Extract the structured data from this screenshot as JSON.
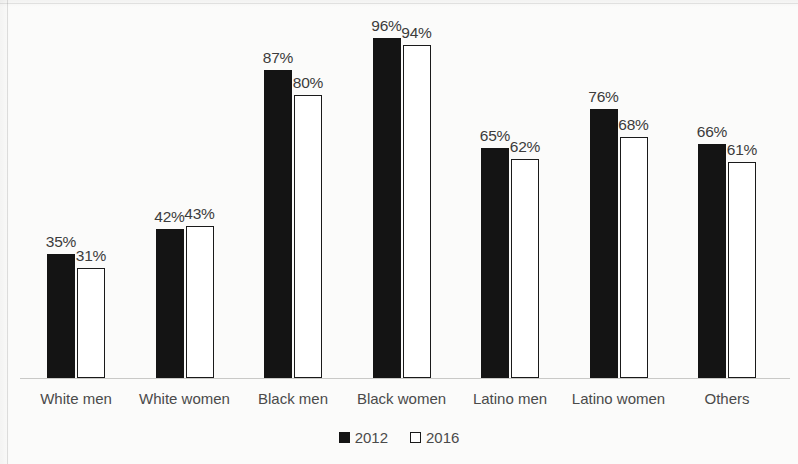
{
  "chart_data": {
    "type": "bar",
    "title": "",
    "subtitle": "",
    "xlabel": "",
    "ylabel": "",
    "ylim": [
      0,
      100
    ],
    "grid": false,
    "legend_position": "bottom-center",
    "value_suffix": "%",
    "categories": [
      "White men",
      "White women",
      "Black men",
      "Black women",
      "Latino men",
      "Latino women",
      "Others"
    ],
    "series": [
      {
        "name": "2012",
        "color": "#141414",
        "style": "filled",
        "values": [
          35,
          42,
          87,
          96,
          65,
          76,
          66
        ],
        "labels": [
          "35%",
          "42%",
          "87%",
          "96%",
          "65%",
          "76%",
          "66%"
        ]
      },
      {
        "name": "2016",
        "color": "#ffffff",
        "style": "outlined",
        "values": [
          31,
          43,
          80,
          94,
          62,
          68,
          61
        ],
        "labels": [
          "31%",
          "43%",
          "80%",
          "94%",
          "62%",
          "68%",
          "61%"
        ]
      }
    ]
  },
  "legend": {
    "items": [
      {
        "label": "2012",
        "swatch": "filled-square-icon"
      },
      {
        "label": "2016",
        "swatch": "hollow-square-icon"
      }
    ]
  }
}
